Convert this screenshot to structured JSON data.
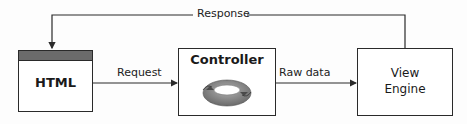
{
  "diagram": {
    "type": "flow",
    "nodes": [
      {
        "id": "html",
        "label": "HTML",
        "has_title_bar": true
      },
      {
        "id": "controller",
        "label": "Controller",
        "icon": "ring-cycle-icon"
      },
      {
        "id": "view_engine",
        "label_line1": "View",
        "label_line2": "Engine"
      }
    ],
    "edges": [
      {
        "from": "html",
        "to": "controller",
        "label": "Request"
      },
      {
        "from": "controller",
        "to": "view_engine",
        "label": "Raw data"
      },
      {
        "from": "view_engine",
        "to": "html",
        "label": "Response"
      }
    ]
  },
  "colors": {
    "stroke": "#2a2a2a",
    "title_bar": "#6b6b6b",
    "ring": "#8a8a8a"
  }
}
